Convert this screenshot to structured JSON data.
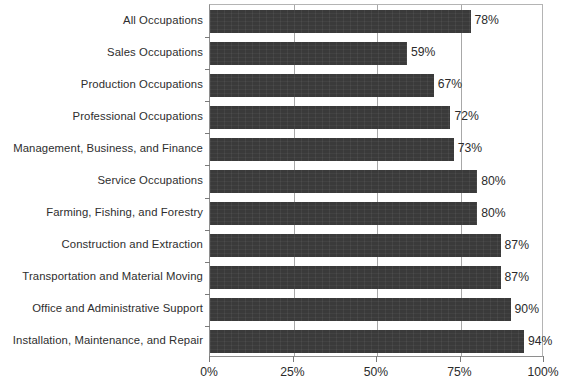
{
  "chart_data": {
    "type": "bar",
    "orientation": "horizontal",
    "title": "",
    "subtitle": "",
    "xlabel": "",
    "ylabel": "",
    "xlim": [
      0,
      100
    ],
    "xticks": [
      "0%",
      "25%",
      "50%",
      "75%",
      "100%"
    ],
    "xtick_values": [
      0,
      25,
      50,
      75,
      100
    ],
    "grid": true,
    "gridlines_at": [
      25,
      50,
      75
    ],
    "legend": null,
    "value_suffix": "%",
    "bar_color": "#3a3a3a",
    "axis_color": "#8e8e8e",
    "categories": [
      "All Occupations",
      "Sales Occupations",
      "Production Occupations",
      "Professional Occupations",
      "Management, Business, and Finance",
      "Service Occupations",
      "Farming, Fishing, and Forestry",
      "Construction and Extraction",
      "Transportation and Material Moving",
      "Office and Administrative Support",
      "Installation, Maintenance, and Repair"
    ],
    "values": [
      78,
      59,
      67,
      72,
      73,
      80,
      80,
      87,
      87,
      90,
      94
    ],
    "value_labels": [
      "78%",
      "59%",
      "67%",
      "72%",
      "73%",
      "80%",
      "80%",
      "87%",
      "87%",
      "90%",
      "94%"
    ]
  }
}
